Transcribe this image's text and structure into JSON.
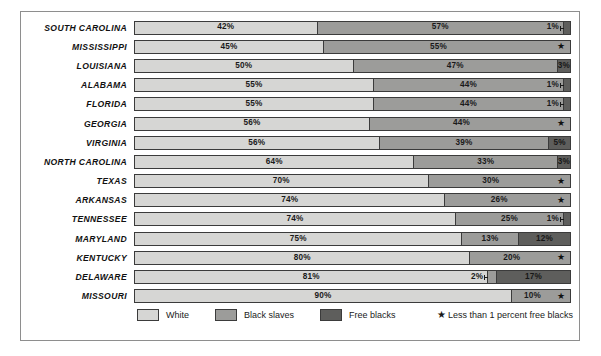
{
  "top_caption": "",
  "chart_data": {
    "type": "bar",
    "subtype": "stacked-horizontal-100",
    "title": "",
    "xlabel": "",
    "ylabel": "",
    "xlim": [
      0,
      100
    ],
    "grid": false,
    "legend_position": "bottom-left",
    "categories": [
      "SOUTH CAROLINA",
      "MISSISSIPPI",
      "LOUISIANA",
      "ALABAMA",
      "FLORIDA",
      "GEORGIA",
      "VIRGINIA",
      "NORTH CAROLINA",
      "TEXAS",
      "ARKANSAS",
      "TENNESSEE",
      "MARYLAND",
      "KENTUCKY",
      "DELAWARE",
      "MISSOURI"
    ],
    "series": [
      {
        "name": "White",
        "color": "#d6d6d4",
        "values": [
          42,
          45,
          50,
          55,
          55,
          56,
          56,
          64,
          70,
          74,
          74,
          75,
          80,
          81,
          90
        ]
      },
      {
        "name": "Black slaves",
        "color": "#9c9c9a",
        "values": [
          57,
          55,
          47,
          44,
          44,
          44,
          39,
          33,
          30,
          26,
          25,
          13,
          20,
          2,
          10
        ]
      },
      {
        "name": "Free blacks",
        "color": "#5e5e5c",
        "values": [
          1,
          0,
          3,
          1,
          1,
          0,
          5,
          3,
          0,
          0,
          1,
          12,
          0,
          17,
          0
        ]
      }
    ],
    "annotations": [
      "Starred rows have less than 1 percent free blacks"
    ]
  },
  "rows": [
    {
      "state": "SOUTH CAROLINA",
      "segments": [
        {
          "kind": "white",
          "value": 42,
          "label": "42%",
          "thin": false
        },
        {
          "kind": "slave",
          "value": 57,
          "label": "57%",
          "thin": false
        },
        {
          "kind": "free",
          "value": 1,
          "label": "1%",
          "thin": true
        }
      ],
      "star": false,
      "star_glyph": ""
    },
    {
      "state": "MISSISSIPPI",
      "segments": [
        {
          "kind": "white",
          "value": 45,
          "label": "45%",
          "thin": false
        },
        {
          "kind": "slave",
          "value": 55,
          "label": "55%",
          "thin": false
        }
      ],
      "star": true,
      "star_glyph": "★"
    },
    {
      "state": "LOUISIANA",
      "segments": [
        {
          "kind": "white",
          "value": 50,
          "label": "50%",
          "thin": false
        },
        {
          "kind": "slave",
          "value": 47,
          "label": "47%",
          "thin": false
        },
        {
          "kind": "free",
          "value": 3,
          "label": "3%",
          "thin": false
        }
      ],
      "star": false,
      "star_glyph": ""
    },
    {
      "state": "ALABAMA",
      "segments": [
        {
          "kind": "white",
          "value": 55,
          "label": "55%",
          "thin": false
        },
        {
          "kind": "slave",
          "value": 44,
          "label": "44%",
          "thin": false
        },
        {
          "kind": "free",
          "value": 1,
          "label": "1%",
          "thin": true
        }
      ],
      "star": false,
      "star_glyph": ""
    },
    {
      "state": "FLORIDA",
      "segments": [
        {
          "kind": "white",
          "value": 55,
          "label": "55%",
          "thin": false
        },
        {
          "kind": "slave",
          "value": 44,
          "label": "44%",
          "thin": false
        },
        {
          "kind": "free",
          "value": 1,
          "label": "1%",
          "thin": true
        }
      ],
      "star": false,
      "star_glyph": ""
    },
    {
      "state": "GEORGIA",
      "segments": [
        {
          "kind": "white",
          "value": 56,
          "label": "56%",
          "thin": false
        },
        {
          "kind": "slave",
          "value": 44,
          "label": "44%",
          "thin": false
        }
      ],
      "star": true,
      "star_glyph": "★"
    },
    {
      "state": "VIRGINIA",
      "segments": [
        {
          "kind": "white",
          "value": 56,
          "label": "56%",
          "thin": false
        },
        {
          "kind": "slave",
          "value": 39,
          "label": "39%",
          "thin": false
        },
        {
          "kind": "free",
          "value": 5,
          "label": "5%",
          "thin": false
        }
      ],
      "star": false,
      "star_glyph": ""
    },
    {
      "state": "NORTH CAROLINA",
      "segments": [
        {
          "kind": "white",
          "value": 64,
          "label": "64%",
          "thin": false
        },
        {
          "kind": "slave",
          "value": 33,
          "label": "33%",
          "thin": false
        },
        {
          "kind": "free",
          "value": 3,
          "label": "3%",
          "thin": false
        }
      ],
      "star": false,
      "star_glyph": ""
    },
    {
      "state": "TEXAS",
      "segments": [
        {
          "kind": "white",
          "value": 70,
          "label": "70%",
          "thin": false
        },
        {
          "kind": "slave",
          "value": 30,
          "label": "30%",
          "thin": false
        }
      ],
      "star": true,
      "star_glyph": "★"
    },
    {
      "state": "ARKANSAS",
      "segments": [
        {
          "kind": "white",
          "value": 74,
          "label": "74%",
          "thin": false
        },
        {
          "kind": "slave",
          "value": 26,
          "label": "26%",
          "thin": false
        }
      ],
      "star": true,
      "star_glyph": "★"
    },
    {
      "state": "TENNESSEE",
      "segments": [
        {
          "kind": "white",
          "value": 74,
          "label": "74%",
          "thin": false
        },
        {
          "kind": "slave",
          "value": 25,
          "label": "25%",
          "thin": false
        },
        {
          "kind": "free",
          "value": 1,
          "label": "1%",
          "thin": true
        }
      ],
      "star": false,
      "star_glyph": ""
    },
    {
      "state": "MARYLAND",
      "segments": [
        {
          "kind": "white",
          "value": 75,
          "label": "75%",
          "thin": false
        },
        {
          "kind": "slave",
          "value": 13,
          "label": "13%",
          "thin": false
        },
        {
          "kind": "free",
          "value": 12,
          "label": "12%",
          "thin": false
        }
      ],
      "star": false,
      "star_glyph": ""
    },
    {
      "state": "KENTUCKY",
      "segments": [
        {
          "kind": "white",
          "value": 80,
          "label": "80%",
          "thin": false
        },
        {
          "kind": "slave",
          "value": 20,
          "label": "20%",
          "thin": false
        }
      ],
      "star": true,
      "star_glyph": "★"
    },
    {
      "state": "DELAWARE",
      "segments": [
        {
          "kind": "white",
          "value": 81,
          "label": "81%",
          "thin": false
        },
        {
          "kind": "slave",
          "value": 2,
          "label": "2%",
          "thin": true
        },
        {
          "kind": "free",
          "value": 17,
          "label": "17%",
          "thin": false
        }
      ],
      "star": false,
      "star_glyph": ""
    },
    {
      "state": "MISSOURI",
      "segments": [
        {
          "kind": "white",
          "value": 90,
          "label": "90%",
          "thin": false
        },
        {
          "kind": "slave",
          "value": 10,
          "label": "10%",
          "thin": false
        }
      ],
      "star": true,
      "star_glyph": "★"
    }
  ],
  "legend": {
    "items": [
      {
        "label": "White",
        "color": "#d6d6d4"
      },
      {
        "label": "Black slaves",
        "color": "#9c9c9a"
      },
      {
        "label": "Free blacks",
        "color": "#5e5e5c"
      }
    ],
    "note_glyph": "★",
    "note_text": "Less than 1 percent free blacks"
  }
}
